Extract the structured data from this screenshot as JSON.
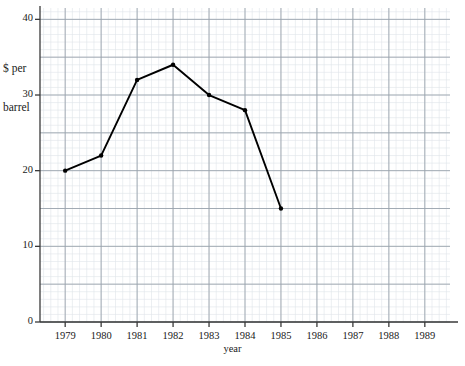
{
  "chart_data": {
    "type": "line",
    "title": "",
    "xlabel": "year",
    "ylabel": "$ per\nbarrel",
    "ylabel_lines": [
      "$ per",
      "barrel"
    ],
    "x": [
      1979,
      1980,
      1981,
      1982,
      1983,
      1984,
      1985
    ],
    "values": [
      20,
      22,
      32,
      34,
      30,
      28,
      15
    ],
    "series": [
      {
        "name": "price",
        "x": [
          1979,
          1980,
          1981,
          1982,
          1983,
          1984,
          1985
        ],
        "values": [
          20,
          22,
          32,
          34,
          30,
          28,
          15
        ]
      }
    ],
    "xlim": [
      1978.3,
      1989.7
    ],
    "ylim": [
      0,
      41.5
    ],
    "xticks": [
      1979,
      1980,
      1981,
      1982,
      1983,
      1984,
      1985,
      1986,
      1987,
      1988,
      1989
    ],
    "xtick_labels": [
      "1979",
      "1980",
      "1981",
      "1982",
      "1983",
      "1984",
      "1985",
      "1986",
      "1987",
      "1988",
      "1989"
    ],
    "yticks": [
      0,
      10,
      20,
      30,
      40
    ],
    "ytick_labels": [
      "0",
      "10",
      "20",
      "30",
      "40"
    ],
    "y_major_grid_step": 5,
    "y_minor_grid_step": 1,
    "x_major_grid_step": 1,
    "x_minor_grid_step": 0.2,
    "grid": true,
    "legend": false,
    "legend_position": "none",
    "line_color": "#000000",
    "marker": "circle",
    "marker_color": "#000000",
    "major_grid_color": "#9aa3ad",
    "minor_grid_color": "#dfe4ea",
    "axis_color": "#3a3a3a",
    "background": "#ffffff"
  }
}
